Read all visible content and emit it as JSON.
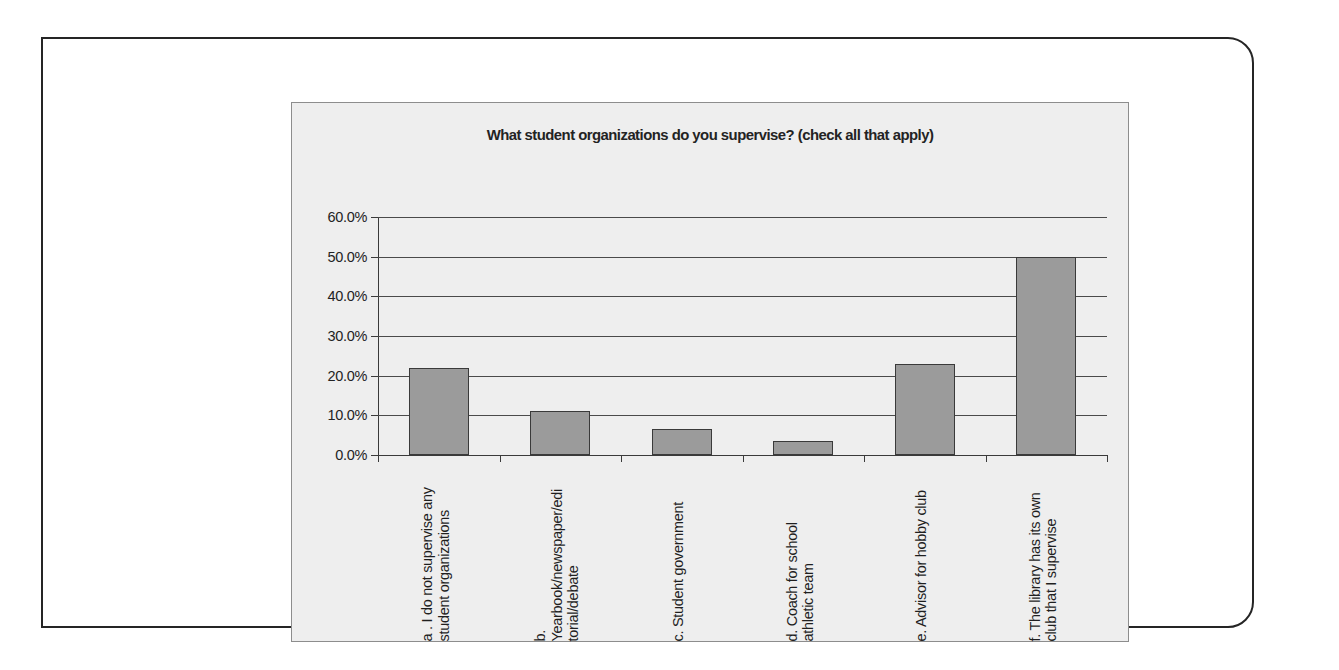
{
  "chart_data": {
    "type": "bar",
    "title": "What student organizations do you supervise? (check all that apply)",
    "xlabel": "",
    "ylabel": "",
    "ylim": [
      0,
      60
    ],
    "ytick_labels": [
      "60.0%",
      "50.0%",
      "40.0%",
      "30.0%",
      "20.0%",
      "10.0%",
      "0.0%"
    ],
    "ytick_values": [
      60,
      50,
      40,
      30,
      20,
      10,
      0
    ],
    "grid": true,
    "legend": "none",
    "categories": [
      "a . I do not supervise any student organizations",
      "b. Yearbook/newspaper/editorial/debate",
      "c. Student government",
      "d. Coach for school athletic team",
      "e. Advisor for hobby club",
      "f. The library has its own club that I supervise"
    ],
    "category_label_lines": [
      [
        "a . I do not supervise any",
        "student organizations"
      ],
      [
        "b.",
        "Yearbook/newspaper/edi",
        "torial/debate"
      ],
      [
        "c. Student government"
      ],
      [
        "d. Coach for school",
        "athletic team"
      ],
      [
        "e. Advisor for hobby club"
      ],
      [
        "f. The library has its own",
        "club that I supervise"
      ]
    ],
    "values": [
      22.0,
      11.0,
      6.5,
      3.5,
      23.0,
      50.0
    ],
    "bar_color": "#9b9b9b",
    "bar_edge_color": "#3a3a3a",
    "plot_background": "#eeeeee"
  }
}
